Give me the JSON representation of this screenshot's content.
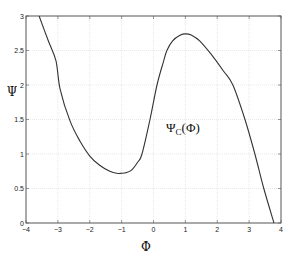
{
  "chart_data": {
    "type": "line",
    "title": "",
    "xlabel": "Φ",
    "ylabel": "Ψ",
    "xlim": [
      -4,
      4
    ],
    "ylim": [
      0,
      3
    ],
    "grid": true,
    "legend": null,
    "xticks": [
      "−4",
      "−3",
      "−2",
      "−1",
      "0",
      "1",
      "2",
      "3",
      "4"
    ],
    "xtick_values": [
      -4,
      -3,
      -2,
      -1,
      0,
      1,
      2,
      3,
      4
    ],
    "yticks": [
      "0",
      "0.5",
      "1",
      "1.5",
      "2",
      "2.5",
      "3"
    ],
    "ytick_values": [
      0,
      0.5,
      1,
      1.5,
      2,
      2.5,
      3
    ],
    "annotation": {
      "text": "Ψ",
      "subscript": "C",
      "suffix": "(Φ)",
      "x": 0.25,
      "y": 1.3
    },
    "series": [
      {
        "name": "Ψ_C(Φ)",
        "color": "#333333",
        "x": [
          -3.59,
          -3.3,
          -3.06,
          -2.93,
          -2.62,
          -2.3,
          -2.0,
          -1.7,
          -1.37,
          -1.15,
          -1.0,
          -0.85,
          -0.68,
          -0.5,
          -0.36,
          -0.11,
          0.11,
          0.3,
          0.42,
          0.6,
          0.83,
          1.0,
          1.2,
          1.45,
          1.8,
          2.2,
          2.49,
          2.87,
          3.18,
          3.46,
          3.78
        ],
        "y": [
          3.0,
          2.64,
          2.35,
          1.94,
          1.48,
          1.18,
          0.97,
          0.84,
          0.75,
          0.72,
          0.72,
          0.73,
          0.77,
          0.88,
          1.0,
          1.5,
          2.0,
          2.32,
          2.5,
          2.64,
          2.72,
          2.74,
          2.72,
          2.64,
          2.45,
          2.2,
          2.0,
          1.5,
          1.0,
          0.5,
          0.0
        ]
      }
    ]
  },
  "plot": {
    "xlabel": "Φ",
    "ylabel": "Ψ"
  }
}
